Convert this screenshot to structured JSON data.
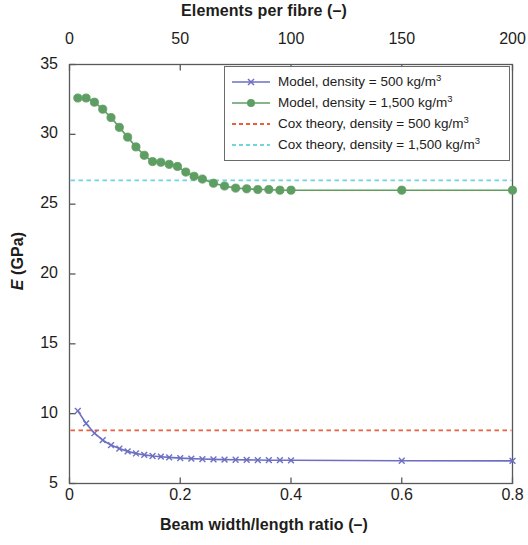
{
  "chart_data": {
    "type": "line",
    "title": "",
    "xlabel": "Beam width/length ratio (–)",
    "xlabel_top": "Elements per fibre (–)",
    "ylabel": "E (GPa)",
    "ylabel_italic_part": "E",
    "ylabel_rest": " (GPa)",
    "xlim": [
      0,
      0.8
    ],
    "xlim_top": [
      0,
      200
    ],
    "ylim": [
      5,
      35
    ],
    "xticks": [
      0,
      0.2,
      0.4,
      0.6,
      0.8
    ],
    "xticklabels": [
      "0",
      "0.2",
      "0.4",
      "0.6",
      "0.8"
    ],
    "xticks_top": [
      0,
      50,
      100,
      150,
      200
    ],
    "xticklabels_top": [
      "0",
      "50",
      "100",
      "150",
      "200"
    ],
    "yticks": [
      5,
      10,
      15,
      20,
      25,
      30,
      35
    ],
    "yticklabels": [
      "5",
      "10",
      "15",
      "20",
      "25",
      "30",
      "35"
    ],
    "grid": false,
    "legend_position": "upper right",
    "series": [
      {
        "name": "Model, density = 500 kg/m3",
        "label_main": "Model, density = 500 kg/m",
        "label_sup": "3",
        "color": "#6d6fc4",
        "style": "solid",
        "marker": "x",
        "x": [
          0.015,
          0.03,
          0.045,
          0.06,
          0.075,
          0.09,
          0.105,
          0.12,
          0.135,
          0.15,
          0.165,
          0.18,
          0.2,
          0.22,
          0.24,
          0.26,
          0.28,
          0.3,
          0.32,
          0.34,
          0.36,
          0.38,
          0.4,
          0.6,
          0.8
        ],
        "y": [
          10.2,
          9.3,
          8.6,
          8.1,
          7.75,
          7.5,
          7.3,
          7.15,
          7.05,
          6.97,
          6.92,
          6.87,
          6.82,
          6.78,
          6.75,
          6.73,
          6.71,
          6.7,
          6.69,
          6.68,
          6.67,
          6.67,
          6.66,
          6.63,
          6.62
        ]
      },
      {
        "name": "Model, density = 1,500 kg/m3",
        "label_main": "Model, density = 1,500 kg/m",
        "label_sup": "3",
        "color": "#5e9e63",
        "style": "solid",
        "marker": "o",
        "x": [
          0.015,
          0.03,
          0.045,
          0.06,
          0.075,
          0.09,
          0.105,
          0.12,
          0.135,
          0.15,
          0.165,
          0.18,
          0.195,
          0.21,
          0.225,
          0.24,
          0.26,
          0.28,
          0.3,
          0.32,
          0.34,
          0.36,
          0.38,
          0.4,
          0.6,
          0.8
        ],
        "y": [
          32.6,
          32.6,
          32.3,
          31.8,
          31.2,
          30.5,
          29.8,
          29.1,
          28.5,
          28.05,
          28.0,
          27.85,
          27.7,
          27.3,
          27.0,
          26.8,
          26.5,
          26.3,
          26.15,
          26.1,
          26.05,
          26.05,
          26.0,
          26.0,
          26.0,
          26.0
        ]
      },
      {
        "name": "Cox theory, density = 500 kg/m3",
        "label_main": "Cox theory, density = 500 kg/m",
        "label_sup": "3",
        "color": "#e8613c",
        "style": "dashed",
        "marker": "none",
        "constant_value": 8.8
      },
      {
        "name": "Cox theory, density = 1,500 kg/m3",
        "label_main": "Cox theory, density = 1,500 kg/m",
        "label_sup": "3",
        "color": "#6fd4e0",
        "style": "dashed",
        "marker": "none",
        "constant_value": 26.7
      }
    ]
  },
  "axes": {
    "top_title": "Elements per fibre (–)",
    "bottom_title": "Beam width/length ratio (–)",
    "y_title_italic": "E",
    "y_title_rest": " (GPa)"
  }
}
